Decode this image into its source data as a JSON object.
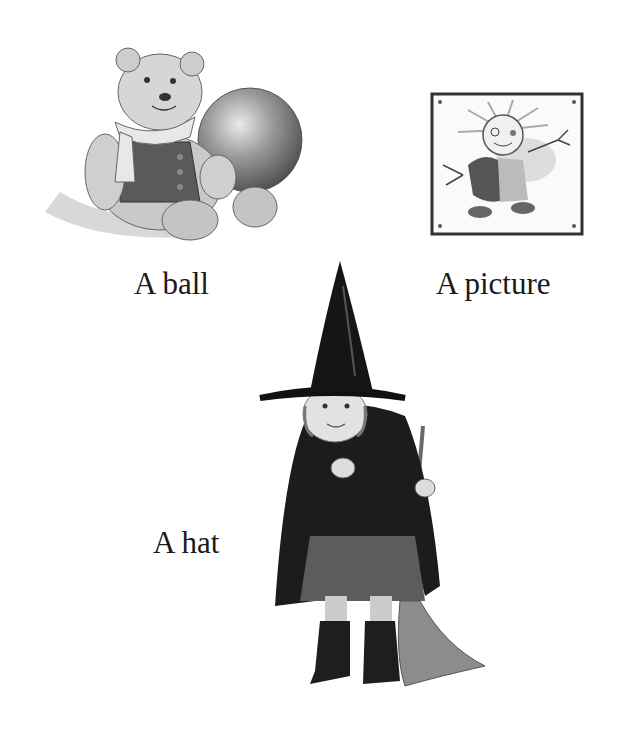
{
  "page": {
    "background": "#ffffff",
    "items": [
      {
        "label": "A ball",
        "illustration": "teddy-bear-with-ball"
      },
      {
        "label": "A picture",
        "illustration": "child-drawing-in-frame"
      },
      {
        "label": "A hat",
        "illustration": "child-in-witch-costume-with-broom"
      }
    ]
  }
}
